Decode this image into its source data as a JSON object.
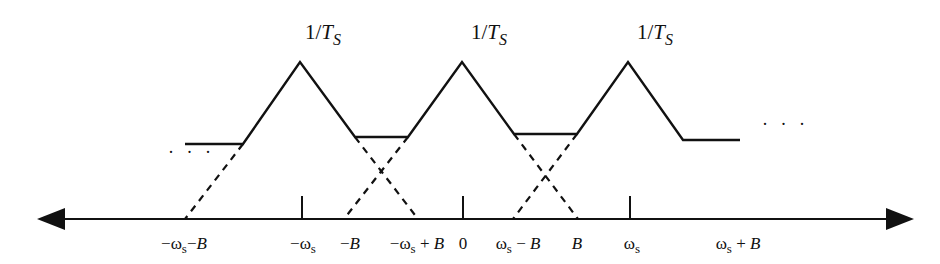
{
  "diagram": {
    "peak_labels": [
      {
        "main": "1/",
        "var": "T",
        "sub": "S"
      },
      {
        "main": "1/",
        "var": "T",
        "sub": "S"
      },
      {
        "main": "1/",
        "var": "T",
        "sub": "S"
      }
    ],
    "axis_labels": [
      {
        "id": "neg-ws-minus-b",
        "pre": "−ω",
        "sub": "s",
        "post": "−",
        "var": "B"
      },
      {
        "id": "neg-ws",
        "pre": "−ω",
        "sub": "s",
        "post": "",
        "var": ""
      },
      {
        "id": "neg-b",
        "pre": "−",
        "sub": "",
        "post": "",
        "var": "B"
      },
      {
        "id": "neg-ws-plus-b",
        "pre": "−ω",
        "sub": "s",
        "post": " + ",
        "var": "B"
      },
      {
        "id": "zero",
        "pre": "0",
        "sub": "",
        "post": "",
        "var": ""
      },
      {
        "id": "ws-minus-b",
        "pre": "ω",
        "sub": "s",
        "post": " − ",
        "var": "B"
      },
      {
        "id": "b",
        "pre": "",
        "sub": "",
        "post": "",
        "var": "B"
      },
      {
        "id": "ws",
        "pre": "ω",
        "sub": "s",
        "post": "",
        "var": ""
      },
      {
        "id": "ws-plus-b",
        "pre": "ω",
        "sub": "s",
        "post": " + ",
        "var": "B"
      }
    ],
    "ellipsis_left": "· · ·",
    "ellipsis_right": "· · ·"
  }
}
